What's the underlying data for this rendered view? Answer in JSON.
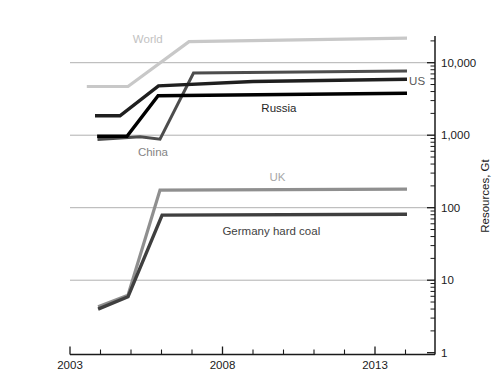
{
  "chart_data": {
    "type": "line",
    "title": "",
    "xlabel": "",
    "ylabel": "Resources, Gt",
    "y_scale": "log",
    "xlim": [
      2003,
      2014.97
    ],
    "ylim": [
      1,
      23000
    ],
    "x_major_ticks": [
      2003,
      2008,
      2013
    ],
    "x_tick_labels": [
      "2003",
      "2008",
      "2013"
    ],
    "x_minor_ticks": [
      2004,
      2005,
      2006,
      2007,
      2009,
      2010,
      2011,
      2012,
      2014
    ],
    "y_major_ticks": [
      1,
      10,
      100,
      1000,
      10000
    ],
    "y_tick_labels": [
      "1",
      "10",
      "100",
      "1,000",
      "10,000"
    ],
    "gridlines_at": [
      10,
      100,
      1000,
      10000
    ],
    "grid_on": true,
    "grid_color": "#b0b0b0",
    "axis_color": "#1a1a1a",
    "tick_label_color": "#1a1a1a",
    "legend_position": "inline-labels",
    "series": [
      {
        "name": "World",
        "color": "#c8c8c8",
        "label_color": "#c2c2c2",
        "width": 3.2,
        "label_at": [
          2005.55,
          21500
        ],
        "points": [
          [
            2003.55,
            4700
          ],
          [
            2004.9,
            4700
          ],
          [
            2006.9,
            19500
          ],
          [
            2014.05,
            21800
          ]
        ]
      },
      {
        "name": "China",
        "color": "#4d4d4d",
        "label_color": "#848484",
        "width": 3.0,
        "label_at": [
          2005.72,
          580
        ],
        "points": [
          [
            2003.9,
            870
          ],
          [
            2005.3,
            950
          ],
          [
            2005.95,
            880
          ],
          [
            2007.05,
            7200
          ],
          [
            2014.05,
            7700
          ]
        ]
      },
      {
        "name": "US",
        "color": "#1f1f1f",
        "label_color": "#595959",
        "width": 3.4,
        "label_at": [
          2014.38,
          5600
        ],
        "points": [
          [
            2003.82,
            1850
          ],
          [
            2004.64,
            1850
          ],
          [
            2005.9,
            4800
          ],
          [
            2009,
            5500
          ],
          [
            2014.05,
            5900
          ]
        ]
      },
      {
        "name": "Russia",
        "color": "#000000",
        "label_color": "#262626",
        "width": 3.4,
        "label_at": [
          2009.85,
          2400
        ],
        "points": [
          [
            2003.89,
            970
          ],
          [
            2004.87,
            970
          ],
          [
            2005.89,
            3500
          ],
          [
            2014.05,
            3800
          ]
        ]
      },
      {
        "name": "UK",
        "color": "#8f8f8f",
        "label_color": "#a8a8a8",
        "width": 3.2,
        "label_at": [
          2009.8,
          265
        ],
        "points": [
          [
            2003.92,
            4.3
          ],
          [
            2004.9,
            6.2
          ],
          [
            2005.95,
            175
          ],
          [
            2014.05,
            180
          ]
        ]
      },
      {
        "name": "Germany hard coal",
        "color": "#3f3f3f",
        "label_color": "#424242",
        "width": 3.4,
        "label_at": [
          2009.6,
          48
        ],
        "points": [
          [
            2003.92,
            4.0
          ],
          [
            2004.9,
            5.9
          ],
          [
            2006.02,
            79
          ],
          [
            2014.05,
            81
          ]
        ]
      }
    ]
  }
}
